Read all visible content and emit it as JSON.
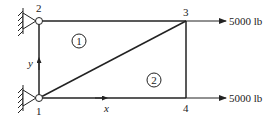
{
  "nodes": [
    {
      "id": "1",
      "label": "1",
      "x": 39,
      "y": 98
    },
    {
      "id": "2",
      "label": "2",
      "x": 39,
      "y": 21
    },
    {
      "id": "3",
      "label": "3",
      "x": 186,
      "y": 21
    },
    {
      "id": "4",
      "label": "4",
      "x": 186,
      "y": 98
    }
  ],
  "elements": [
    {
      "label": "1"
    },
    {
      "label": "2"
    }
  ],
  "axes": {
    "x_label": "x",
    "y_label": "y"
  },
  "loads": [
    {
      "node": "3",
      "label": "5000 lb"
    },
    {
      "node": "4",
      "label": "5000 lb"
    }
  ],
  "colors": {
    "line": "#222222"
  }
}
